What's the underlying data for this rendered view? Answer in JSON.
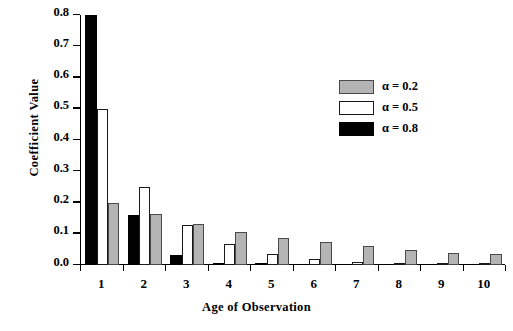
{
  "chart_data": {
    "type": "bar",
    "title": "",
    "xlabel": "Age of Observation",
    "ylabel": "Coefficient Value",
    "categories": [
      "1",
      "2",
      "3",
      "4",
      "5",
      "6",
      "7",
      "8",
      "9",
      "10"
    ],
    "ylim": [
      0.0,
      0.8
    ],
    "yticks": [
      "0.0",
      "0.1",
      "0.2",
      "0.3",
      "0.4",
      "0.5",
      "0.6",
      "0.7",
      "0.8"
    ],
    "ytick_values": [
      0.0,
      0.1,
      0.2,
      0.3,
      0.4,
      0.5,
      0.6,
      0.7,
      0.8
    ],
    "grid": false,
    "legend_position": "upper right",
    "bar_order_in_group": [
      "alpha_0.8",
      "alpha_0.5",
      "alpha_0.2"
    ],
    "series": [
      {
        "name": "α = 0.8",
        "key": "alpha_0.8",
        "color": "#000000",
        "values": [
          0.8,
          0.16,
          0.032,
          0.008,
          0.002,
          0.0,
          0.0,
          0.0,
          0.0,
          0.0
        ]
      },
      {
        "name": "α = 0.5",
        "key": "alpha_0.5",
        "color": "#ffffff",
        "values": [
          0.5,
          0.25,
          0.128,
          0.066,
          0.034,
          0.018,
          0.01,
          0.005,
          0.003,
          0.002
        ]
      },
      {
        "name": "α = 0.2",
        "key": "alpha_0.2",
        "color": "#b4b4b4",
        "values": [
          0.2,
          0.162,
          0.13,
          0.106,
          0.088,
          0.074,
          0.06,
          0.049,
          0.04,
          0.035
        ]
      }
    ]
  },
  "legend": {
    "items": [
      {
        "label": "α = 0.2",
        "swatch": "s02"
      },
      {
        "label": "α = 0.5",
        "swatch": "s05"
      },
      {
        "label": "α = 0.8",
        "swatch": "s08"
      }
    ]
  }
}
